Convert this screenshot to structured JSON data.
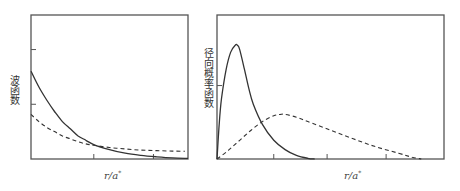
{
  "chart_data": [
    {
      "type": "line",
      "title": "",
      "xlabel": "r/a*",
      "xlabel_base": "r/a",
      "xlabel_superscript": "*",
      "ylabel": "波函数",
      "grid": false,
      "legend": null,
      "note": "Qualitative reconstruction: curve values are approximated by eye from the image and are in arbitrary normalized units; the figure has no numeric axis labels.",
      "xlim": [
        0,
        1
      ],
      "ylim": [
        0,
        1
      ],
      "x_ticks": [
        0.4,
        0.78
      ],
      "y_ticks": [
        0.38,
        0.76
      ],
      "series": [
        {
          "name": "solid",
          "style": "solid",
          "x": [
            0,
            0.05,
            0.1,
            0.15,
            0.2,
            0.25,
            0.3,
            0.35,
            0.4,
            0.5,
            0.6,
            0.7,
            0.8,
            0.9,
            1.0
          ],
          "y": [
            0.61,
            0.5,
            0.41,
            0.33,
            0.26,
            0.21,
            0.16,
            0.13,
            0.1,
            0.065,
            0.04,
            0.025,
            0.015,
            0.008,
            0.004
          ]
        },
        {
          "name": "dashed",
          "style": "dashed",
          "x": [
            0,
            0.05,
            0.1,
            0.15,
            0.2,
            0.25,
            0.3,
            0.35,
            0.4,
            0.5,
            0.6,
            0.7,
            0.8,
            0.9,
            0.98
          ],
          "y": [
            0.31,
            0.26,
            0.22,
            0.19,
            0.16,
            0.14,
            0.12,
            0.105,
            0.095,
            0.08,
            0.07,
            0.062,
            0.058,
            0.055,
            0.054
          ]
        }
      ]
    },
    {
      "type": "line",
      "title": "",
      "xlabel": "r/a*",
      "xlabel_base": "r/a",
      "xlabel_superscript": "*",
      "ylabel": "径向概率函数",
      "grid": false,
      "legend": null,
      "note": "Qualitative reconstruction: curve values are approximated by eye from the image and are in arbitrary normalized units; the figure has no numeric axis labels.",
      "xlim": [
        0,
        1
      ],
      "ylim": [
        0,
        1
      ],
      "x_ticks": [
        0.25,
        0.485,
        0.745
      ],
      "y_ticks": [
        0.51
      ],
      "series": [
        {
          "name": "solid",
          "style": "solid",
          "x": [
            0,
            0.01,
            0.02,
            0.04,
            0.06,
            0.08,
            0.09,
            0.1,
            0.12,
            0.14,
            0.16,
            0.2,
            0.25,
            0.3,
            0.35,
            0.4,
            0.43
          ],
          "y": [
            0,
            0.25,
            0.42,
            0.62,
            0.74,
            0.79,
            0.79,
            0.76,
            0.63,
            0.49,
            0.38,
            0.24,
            0.13,
            0.065,
            0.025,
            0.005,
            0
          ]
        },
        {
          "name": "dashed",
          "style": "dashed",
          "x": [
            0,
            0.05,
            0.1,
            0.15,
            0.2,
            0.25,
            0.28,
            0.3,
            0.35,
            0.4,
            0.5,
            0.6,
            0.7,
            0.8,
            0.86,
            0.9
          ],
          "y": [
            0,
            0.06,
            0.13,
            0.2,
            0.26,
            0.3,
            0.31,
            0.31,
            0.29,
            0.26,
            0.2,
            0.14,
            0.085,
            0.04,
            0.012,
            0
          ]
        }
      ]
    }
  ]
}
